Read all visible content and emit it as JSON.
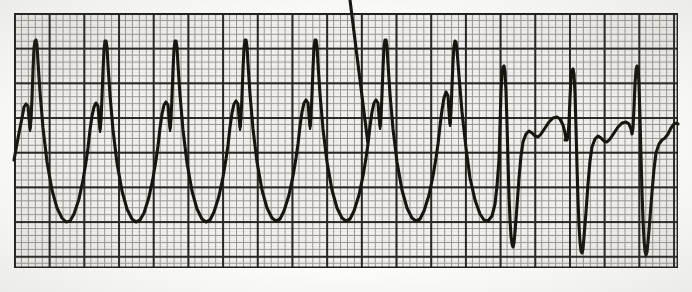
{
  "document": {
    "kind": "ecg-rhythm-strip",
    "title": "ECG Rhythm Strip",
    "description": "Single-lead electrocardiogram tracing on standard graph paper showing a run of wide, bizarre, high-amplitude complexes that abruptly converts to narrower complexes with deep S waves and rounded T waves.",
    "background_color": "#ffffff",
    "paper_color": "#f2f0ee",
    "trace_color": "#17150f",
    "fine_grid_color": "#8d8a86",
    "bold_grid_color": "#1d1b19"
  },
  "paper": {
    "left": 14,
    "top": 13,
    "width": 664,
    "height": 255,
    "small_square_px": 6.94,
    "large_square_px": 34.7,
    "small_squares_per_large": 5,
    "border": true
  },
  "chart_data": {
    "type": "line",
    "title": "",
    "xlabel": "",
    "ylabel": "",
    "grid": true,
    "legend": false,
    "xlim": [
      0,
      692
    ],
    "ylim": [
      292,
      0
    ],
    "baseline_y": 150,
    "segments": [
      {
        "name": "wide-complex-run",
        "beat_count": 8,
        "first_beat_x": 26,
        "beat_interval_px": 55.5,
        "r_peak_y": 40,
        "notch_y": 103,
        "trough_y": 222,
        "description": "Wide bizarre complexes with a small pre-spike notch, tall narrow R spike and deep broad negative trough"
      },
      {
        "name": "narrow-complex-run",
        "beat_count": 3,
        "first_beat_x": 500,
        "beat_interval_px": 66,
        "r_peak_y": 66,
        "s_trough_y": 252,
        "t_wave_y": 124,
        "description": "Narrow QRS with deep narrow S wave followed by a rounded T wave"
      }
    ],
    "trace_path": "M 14 160 L 19 133 L 22 118 L 24 107 L 26 104 L 28 106 L 29 118 L 30 128 L 31 120 L 32 98 L 33 70 L 34 48 L 35 41 L 36 40 L 37 45 L 38 62 L 40 92 L 43 128 L 47 162 L 52 190 L 57 208 L 62 218 L 66 222 L 70 221 L 74 214 L 79 199 L 83 180 L 86 162 L 88 148 L 90 130 L 92 116 L 94 107 L 96 103 L 98 106 L 99 119 L 100 129 L 101 120 L 102 97 L 103 71 L 104 50 L 105 41 L 106 41 L 107 47 L 108 65 L 110 95 L 113 130 L 117 163 L 122 191 L 127 209 L 132 219 L 136 222 L 140 220 L 144 213 L 149 197 L 153 178 L 156 160 L 158 146 L 160 128 L 162 114 L 164 105 L 166 102 L 168 105 L 169 118 L 170 128 L 171 119 L 172 96 L 173 70 L 174 49 L 175 41 L 176 41 L 177 47 L 178 65 L 180 95 L 183 130 L 187 163 L 192 191 L 197 209 L 202 219 L 206 222 L 210 220 L 214 212 L 219 196 L 223 177 L 226 159 L 228 145 L 230 127 L 232 113 L 234 104 L 236 101 L 238 104 L 239 117 L 240 127 L 241 118 L 242 95 L 243 69 L 244 48 L 245 40 L 246 40 L 247 46 L 248 64 L 250 94 L 253 129 L 257 162 L 262 190 L 267 208 L 272 218 L 276 221 L 280 219 L 284 211 L 289 195 L 293 176 L 296 158 L 298 144 L 300 126 L 302 112 L 304 103 L 306 100 L 308 103 L 309 116 L 310 126 L 311 117 L 312 94 L 313 68 L 314 47 L 315 40 L 316 40 L 317 46 L 318 64 L 320 94 L 323 129 L 327 162 L 332 190 L 337 208 L 342 218 L 346 221 L 350 219 L 354 211 L 359 195 L 363 176 L 366 158 L 368 144 L 350 0 M 350 219 L 354 211 L 359 195 L 363 176 L 366 158 L 368 144 L 370 126 L 372 112 L 374 103 L 376 100 L 378 103 L 379 116 L 380 126 L 381 117 L 382 94 L 383 68 L 384 47 L 385 40 L 386 40 L 387 46 L 388 64 L 390 94 L 393 129 L 397 162 L 402 190 L 407 208 L 412 218 L 416 221 L 420 219 L 424 211 L 429 195 L 433 176 L 436 158 L 438 144 L 440 126 L 442 110 L 444 98 L 446 92 L 448 96 L 449 112 L 450 124 L 451 112 L 452 86 L 453 62 L 454 46 L 455 41 L 456 42 L 457 50 L 459 76 L 462 112 L 466 148 L 470 178 L 475 200 L 480 214 L 484 220 L 488 221 L 492 216 L 495 204 L 497 186 L 499 160 L 500 126 L 501 92 L 502 74 L 503 67 L 504 66 L 505 72 L 506 92 L 507 124 L 508 160 L 509 196 L 510 220 L 511 236 L 512 244 L 513 247 L 514 243 L 515 232 L 517 206 L 519 178 L 521 156 L 523 142 L 526 134 L 529 131 L 532 133 L 535 136 L 538 137 L 541 134 L 545 128 L 549 122 L 553 118 L 557 117 L 560 119 L 563 125 L 565 133 L 566 139 L 567 140 L 565 140 L 566 139 L 567 140 L 568 136 L 569 122 L 570 98 L 571 78 L 572 70 L 573 69 L 574 74 L 575 94 L 576 128 L 577 166 L 578 200 L 579 226 L 580 242 L 581 251 L 582 253 L 583 249 L 584 237 L 586 212 L 588 184 L 590 161 L 592 147 L 595 139 L 598 136 L 601 138 L 604 141 L 607 142 L 610 139 L 614 133 L 618 127 L 622 123 L 626 122 L 629 124 L 631 129 L 632 134 L 633 128 L 634 108 L 635 84 L 636 70 L 637 66 L 638 68 L 639 84 L 640 118 L 641 156 L 642 192 L 643 220 L 644 240 L 645 251 L 646 255 L 647 252 L 648 242 L 650 218 L 652 192 L 654 169 L 656 153 L 659 144 L 662 140 L 665 138 L 668 134 L 671 128 L 674 124 L 677 123 L 678 124",
    "trace_path_accents": "M 29 113 L 30 131 L 31 126 L 30 112 Z M 99 114 L 100 132 L 101 126 L 100 111 Z M 169 113 L 170 131 L 171 125 L 170 110 Z M 239 112 L 240 130 L 241 124 L 240 109 Z M 309 111 L 310 129 L 311 123 L 310 108 Z M 379 111 L 380 129 L 381 123 L 380 108 Z M 449 107 L 450 126 L 451 120 L 450 104 Z"
  }
}
